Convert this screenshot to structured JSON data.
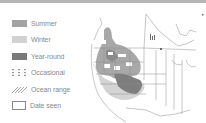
{
  "legend": {
    "items": [
      {
        "label": "Summer",
        "swatch": "summer",
        "color": "#a3a3a3"
      },
      {
        "label": "Winter",
        "swatch": "winter",
        "color": "#d2d2d2"
      },
      {
        "label": "Year-round",
        "swatch": "year-round",
        "color": "#7a7a7a"
      },
      {
        "label": "Occasional",
        "swatch": "occasional-dots",
        "color": "#9a9a9a"
      },
      {
        "label": "Ocean range",
        "swatch": "ocean-hatch",
        "color": "#9a9a9a"
      },
      {
        "label": "Date seen",
        "swatch": "outline-box",
        "color": "#8a8a8a"
      }
    ]
  },
  "map": {
    "region": "North America range map",
    "colors": {
      "summer": "#a3a3a3",
      "winter": "#d2d2d2",
      "year_round": "#7a7a7a",
      "borders": "#8f8f8f"
    }
  }
}
